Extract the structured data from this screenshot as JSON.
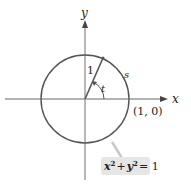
{
  "diagram": {
    "type": "unit-circle",
    "axes": {
      "x_label": "x",
      "y_label": "y"
    },
    "radius_label": "1",
    "arc_label": "s",
    "angle_label": "t",
    "point_label": "(1, 0)",
    "equation": {
      "x": "x",
      "plus": "+",
      "y": "y",
      "exp": "2",
      "rhs": "= 1"
    },
    "colors": {
      "axis": "#9a9a9a",
      "circle": "#555555",
      "radius": "#555555",
      "equation_box": "#e6e6e6",
      "leader": "#c8c8c8",
      "text": "#222222"
    }
  }
}
